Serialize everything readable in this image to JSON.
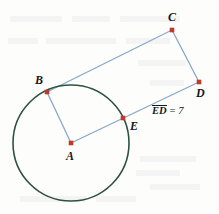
{
  "figure": {
    "kind": "circle-tangent-secant-geometry-diagram",
    "width": 219,
    "height": 214,
    "background_color": "#fdfdfb",
    "circle": {
      "name": "circle-A",
      "center_label": "A",
      "cx": 71,
      "cy": 143,
      "r": 58,
      "stroke_color": "#2d5242",
      "stroke_width": 1.6
    },
    "segment_style": {
      "stroke_color": "#8aa8c8",
      "stroke_width": 1.3
    },
    "point_style": {
      "fill_color": "#c0392b",
      "size": 4.6,
      "shape": "square"
    },
    "points": [
      {
        "id": "A",
        "label": "A",
        "x": 71,
        "y": 143,
        "label_x": 66,
        "label_y": 150,
        "on_circle": false,
        "role": "center"
      },
      {
        "id": "B",
        "label": "B",
        "x": 47,
        "y": 92,
        "label_x": 35,
        "label_y": 74,
        "on_circle": true,
        "role": "tangent-point"
      },
      {
        "id": "C",
        "label": "C",
        "x": 172,
        "y": 30,
        "label_x": 168,
        "label_y": 11,
        "on_circle": false,
        "role": "vertex"
      },
      {
        "id": "D",
        "label": "D",
        "x": 199,
        "y": 82,
        "label_x": 196,
        "label_y": 87,
        "on_circle": false,
        "role": "vertex"
      },
      {
        "id": "E",
        "label": "E",
        "x": 123,
        "y": 118,
        "label_x": 130,
        "label_y": 120,
        "on_circle": true,
        "role": "intersection"
      }
    ],
    "segments": [
      {
        "id": "AB",
        "from": "A",
        "to": "B",
        "description": "radius-A-to-B"
      },
      {
        "id": "AD",
        "from": "A",
        "to": "D",
        "description": "radius-through-E-to-D"
      },
      {
        "id": "BC",
        "from": "B",
        "to": "C",
        "description": "side-B-to-C"
      },
      {
        "id": "CD",
        "from": "C",
        "to": "D",
        "description": "side-C-to-D"
      }
    ],
    "measure": {
      "id": "ED-measure",
      "segment_text": "ED",
      "equals_text": " = ",
      "value_text": "7",
      "full_text": "ED = 7",
      "x": 152,
      "y": 105
    }
  }
}
